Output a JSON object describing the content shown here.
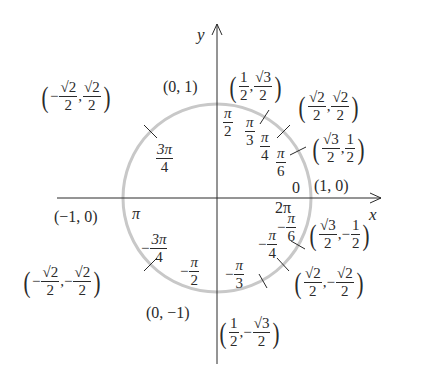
{
  "diagram": {
    "colors": {
      "axis": "#2a2a2a",
      "circle": "#c8c8c8",
      "text": "#2a2a2a"
    },
    "axes": {
      "x_label": "x",
      "y_label": "y"
    },
    "axis_points": {
      "pos_x": "(1, 0)",
      "neg_x": "(−1, 0)",
      "pos_y": "(0, 1)",
      "neg_y": "(0, −1)"
    },
    "angles": {
      "zero": "0",
      "two_pi": "2π",
      "pi": "π",
      "pi_over_2": {
        "num": "π",
        "den": "2"
      },
      "pi_over_3": {
        "num": "π",
        "den": "3"
      },
      "pi_over_4": {
        "num": "π",
        "den": "4"
      },
      "pi_over_6": {
        "num": "π",
        "den": "6"
      },
      "three_pi_over_4": {
        "num": "3π",
        "den": "4"
      },
      "neg_three_pi_over_4": {
        "sign": "−",
        "num": "3π",
        "den": "4"
      },
      "neg_pi_over_2": {
        "sign": "−",
        "num": "π",
        "den": "2"
      },
      "neg_pi_over_3": {
        "sign": "−",
        "num": "π",
        "den": "3"
      },
      "neg_pi_over_4": {
        "sign": "−",
        "num": "π",
        "den": "4"
      },
      "neg_pi_over_6": {
        "sign": "−",
        "num": "π",
        "den": "6"
      }
    },
    "coordinates": {
      "q1_pi6": {
        "x": {
          "sign": "",
          "num": "√3",
          "den": "2"
        },
        "y": {
          "sign": "",
          "num": "1",
          "den": "2"
        }
      },
      "q1_pi4": {
        "x": {
          "sign": "",
          "num": "√2",
          "den": "2"
        },
        "y": {
          "sign": "",
          "num": "√2",
          "den": "2"
        }
      },
      "q1_pi3": {
        "x": {
          "sign": "",
          "num": "1",
          "den": "2"
        },
        "y": {
          "sign": "",
          "num": "√3",
          "den": "2"
        }
      },
      "q2_3pi4": {
        "x": {
          "sign": "−",
          "num": "√2",
          "den": "2"
        },
        "y": {
          "sign": "",
          "num": "√2",
          "den": "2"
        }
      },
      "q3_neg3pi4": {
        "x": {
          "sign": "−",
          "num": "√2",
          "den": "2"
        },
        "y": {
          "sign": "−",
          "num": "√2",
          "den": "2"
        }
      },
      "q4_negpi6": {
        "x": {
          "sign": "",
          "num": "√3",
          "den": "2"
        },
        "y": {
          "sign": "−",
          "num": "1",
          "den": "2"
        }
      },
      "q4_negpi4": {
        "x": {
          "sign": "",
          "num": "√2",
          "den": "2"
        },
        "y": {
          "sign": "−",
          "num": "√2",
          "den": "2"
        }
      },
      "q4_negpi3": {
        "x": {
          "sign": "",
          "num": "1",
          "den": "2"
        },
        "y": {
          "sign": "−",
          "num": "√3",
          "den": "2"
        }
      }
    },
    "separator": ","
  }
}
